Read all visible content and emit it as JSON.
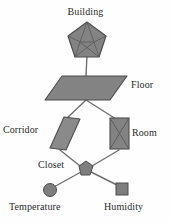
{
  "diagram": {
    "type": "tree",
    "background_color": "#fefefe",
    "shape_fill_color": "#838383",
    "shape_stroke_color": "#555555",
    "edge_color": "#6f6f6f",
    "label_color": "#2b2b2b",
    "nodes": [
      {
        "id": "building",
        "label": "Building",
        "shape": "pentagon-wireframe",
        "label_position": "above",
        "x": 87,
        "y": 41
      },
      {
        "id": "floor",
        "label": "Floor",
        "shape": "parallelogram",
        "label_position": "right",
        "x": 85,
        "y": 87
      },
      {
        "id": "corridor",
        "label": "Corridor",
        "shape": "slanted-parallelogram",
        "label_position": "left",
        "x": 65,
        "y": 133
      },
      {
        "id": "room",
        "label": "Room",
        "shape": "rectangle-with-cross",
        "label_position": "right",
        "x": 119,
        "y": 133
      },
      {
        "id": "closet",
        "label": "Closet",
        "shape": "small-pentagon",
        "label_position": "left",
        "x": 86,
        "y": 168
      },
      {
        "id": "temperature",
        "label": "Temperature",
        "shape": "circle",
        "label_position": "below",
        "x": 50,
        "y": 190
      },
      {
        "id": "humidity",
        "label": "Humidity",
        "shape": "square",
        "label_position": "below",
        "x": 122,
        "y": 189
      }
    ],
    "edges": [
      {
        "from": "building",
        "to": "floor"
      },
      {
        "from": "floor",
        "to": "corridor"
      },
      {
        "from": "floor",
        "to": "room"
      },
      {
        "from": "corridor",
        "to": "closet"
      },
      {
        "from": "room",
        "to": "closet"
      },
      {
        "from": "closet",
        "to": "temperature"
      },
      {
        "from": "closet",
        "to": "humidity"
      }
    ]
  }
}
